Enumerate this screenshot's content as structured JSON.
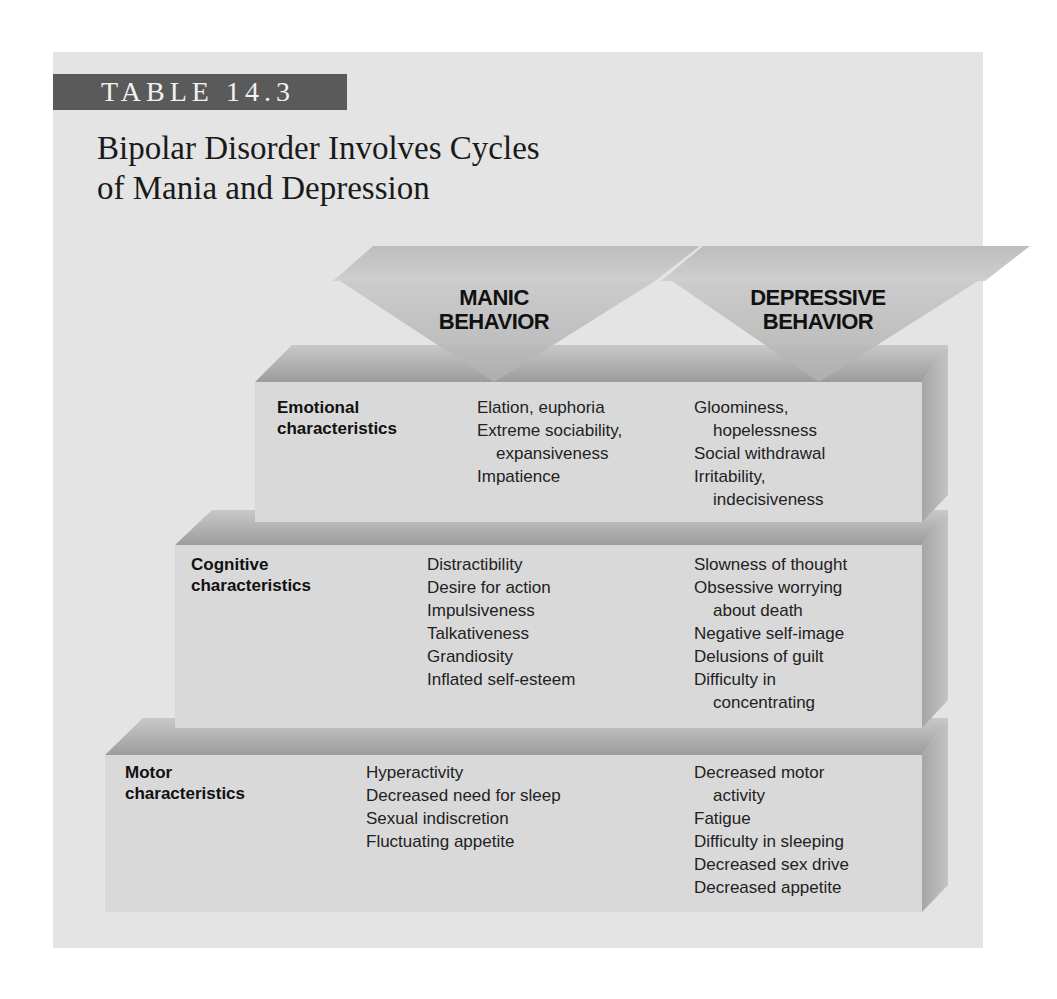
{
  "table": {
    "label": "TABLE 14.3",
    "title_line1": "Bipolar Disorder Involves Cycles",
    "title_line2": "of Mania and Depression",
    "columns": {
      "manic": {
        "line1": "MANIC",
        "line2": "BEHAVIOR"
      },
      "depressive": {
        "line1": "DEPRESSIVE",
        "line2": "BEHAVIOR"
      }
    },
    "rows": [
      {
        "label_line1": "Emotional",
        "label_line2": "characteristics",
        "manic": [
          {
            "text": "Elation, euphoria",
            "indent": false
          },
          {
            "text": "Extreme sociability,",
            "indent": false
          },
          {
            "text": "expansiveness",
            "indent": true
          },
          {
            "text": "Impatience",
            "indent": false
          }
        ],
        "depressive": [
          {
            "text": "Gloominess,",
            "indent": false
          },
          {
            "text": "hopelessness",
            "indent": true
          },
          {
            "text": "Social withdrawal",
            "indent": false
          },
          {
            "text": "Irritability,",
            "indent": false
          },
          {
            "text": "indecisiveness",
            "indent": true
          }
        ]
      },
      {
        "label_line1": "Cognitive",
        "label_line2": "characteristics",
        "manic": [
          {
            "text": "Distractibility",
            "indent": false
          },
          {
            "text": "Desire for action",
            "indent": false
          },
          {
            "text": "Impulsiveness",
            "indent": false
          },
          {
            "text": "Talkativeness",
            "indent": false
          },
          {
            "text": "Grandiosity",
            "indent": false
          },
          {
            "text": "Inflated self-esteem",
            "indent": false
          }
        ],
        "depressive": [
          {
            "text": "Slowness of thought",
            "indent": false
          },
          {
            "text": "Obsessive worrying",
            "indent": false
          },
          {
            "text": "about death",
            "indent": true
          },
          {
            "text": "Negative self-image",
            "indent": false
          },
          {
            "text": "Delusions of guilt",
            "indent": false
          },
          {
            "text": "Difficulty in",
            "indent": false
          },
          {
            "text": "concentrating",
            "indent": true
          }
        ]
      },
      {
        "label_line1": "Motor",
        "label_line2": "characteristics",
        "manic": [
          {
            "text": "Hyperactivity",
            "indent": false
          },
          {
            "text": "Decreased need for sleep",
            "indent": false
          },
          {
            "text": "Sexual indiscretion",
            "indent": false
          },
          {
            "text": "Fluctuating appetite",
            "indent": false
          }
        ],
        "depressive": [
          {
            "text": "Decreased motor",
            "indent": false
          },
          {
            "text": "activity",
            "indent": true
          },
          {
            "text": "Fatigue",
            "indent": false
          },
          {
            "text": "Difficulty in sleeping",
            "indent": false
          },
          {
            "text": "Decreased sex drive",
            "indent": false
          },
          {
            "text": "Decreased appetite",
            "indent": false
          }
        ]
      }
    ]
  },
  "colors": {
    "page": "#ffffff",
    "panel": "#e4e4e4",
    "label_bg": "#5a5a5a",
    "face_front": "#d9d9d9",
    "face_top": "#a8a8a8",
    "face_side": "#9a9a9a"
  }
}
